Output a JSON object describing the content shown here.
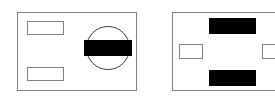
{
  "figure": {
    "canvas": {
      "width": 275,
      "height": 104
    },
    "background_color": "#ffffff",
    "outline_color": "#808080",
    "fill_color": "#000000",
    "ellipse_outline_color": "#3c3c3c"
  },
  "panels": [
    {
      "id": "panel-left",
      "name": "left-panel",
      "label": "Left panel",
      "x": 17,
      "y": 12,
      "width": 120,
      "height": 79,
      "shapes": [
        {
          "id": "left-rect-top",
          "name": "left-panel-rect-top",
          "label": "Top outline rectangle",
          "type": "rect-outline",
          "x": 9,
          "y": 8,
          "width": 37,
          "height": 14
        },
        {
          "id": "left-rect-bottom",
          "name": "left-panel-rect-bottom",
          "label": "Bottom outline rectangle",
          "type": "rect-outline",
          "x": 9,
          "y": 54,
          "width": 37,
          "height": 14
        },
        {
          "id": "left-ellipse",
          "name": "left-panel-ellipse",
          "label": "Circle outline",
          "type": "ellipse-outline",
          "x": 68,
          "y": 13,
          "width": 44,
          "height": 44
        },
        {
          "id": "left-bar",
          "name": "left-panel-filled-bar",
          "label": "Black filled bar inside circle",
          "type": "rect-filled",
          "x": 66,
          "y": 27,
          "width": 48,
          "height": 16
        }
      ]
    },
    {
      "id": "panel-right",
      "name": "right-panel",
      "label": "Right panel",
      "x": 172,
      "y": 12,
      "width": 112,
      "height": 79,
      "shapes": [
        {
          "id": "right-bar-top",
          "name": "right-panel-filled-bar-top",
          "label": "Top black filled bar",
          "type": "rect-filled",
          "x": 36,
          "y": 5,
          "width": 47,
          "height": 16
        },
        {
          "id": "right-bar-bottom",
          "name": "right-panel-filled-bar-bottom",
          "label": "Bottom black filled bar",
          "type": "rect-filled",
          "x": 36,
          "y": 57,
          "width": 47,
          "height": 16
        },
        {
          "id": "right-rect-left",
          "name": "right-panel-rect-left",
          "label": "Left small outline rectangle",
          "type": "rect-outline",
          "x": 6,
          "y": 31,
          "width": 24,
          "height": 15
        },
        {
          "id": "right-rect-right",
          "name": "right-panel-rect-right",
          "label": "Right small outline rectangle",
          "type": "rect-outline",
          "x": 89,
          "y": 31,
          "width": 24,
          "height": 15
        }
      ]
    }
  ]
}
